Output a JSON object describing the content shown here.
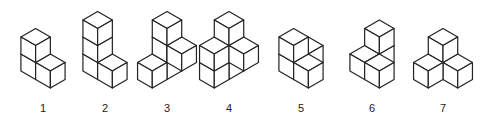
{
  "figures": [
    {
      "label": "1",
      "cx": 43,
      "base_y": 88,
      "cubes": [
        [
          0,
          0,
          0
        ],
        [
          1,
          0,
          0
        ],
        [
          0,
          0,
          1
        ]
      ]
    },
    {
      "label": "2",
      "cx": 105,
      "base_y": 88,
      "cubes": [
        [
          0,
          0,
          0
        ],
        [
          1,
          0,
          0
        ],
        [
          0,
          0,
          1
        ],
        [
          0,
          0,
          2
        ]
      ]
    },
    {
      "label": "3",
      "cx": 167,
      "base_y": 88,
      "cubes": [
        [
          0,
          1,
          0
        ],
        [
          0,
          0,
          0
        ],
        [
          1,
          0,
          1
        ],
        [
          0,
          0,
          1
        ],
        [
          0,
          0,
          2
        ]
      ]
    },
    {
      "label": "4",
      "cx": 229,
      "base_y": 88,
      "cubes": [
        [
          0,
          1,
          0
        ],
        [
          0,
          0,
          0
        ],
        [
          0,
          1,
          1
        ],
        [
          0,
          0,
          1
        ],
        [
          1,
          0,
          1
        ],
        [
          0,
          0,
          2
        ]
      ]
    },
    {
      "label": "5",
      "cx": 301,
      "base_y": 88,
      "cubes": [
        [
          0,
          0,
          0
        ],
        [
          1,
          0,
          0
        ],
        [
          0,
          0,
          1
        ],
        [
          0,
          -1,
          0
        ]
      ]
    },
    {
      "label": "6",
      "cx": 372,
      "base_y": 88,
      "cubes": [
        [
          0,
          0,
          0
        ],
        [
          1,
          0,
          0
        ],
        [
          0,
          -1,
          0
        ],
        [
          0,
          -1,
          1
        ]
      ]
    },
    {
      "label": "7",
      "cx": 443,
      "base_y": 88,
      "cubes": [
        [
          0,
          0,
          0
        ],
        [
          1,
          0,
          0
        ],
        [
          0,
          1,
          0
        ],
        [
          0,
          0,
          1
        ]
      ]
    }
  ],
  "style": {
    "stroke": "#222222",
    "fill": "#ffffff",
    "edge": 17
  }
}
